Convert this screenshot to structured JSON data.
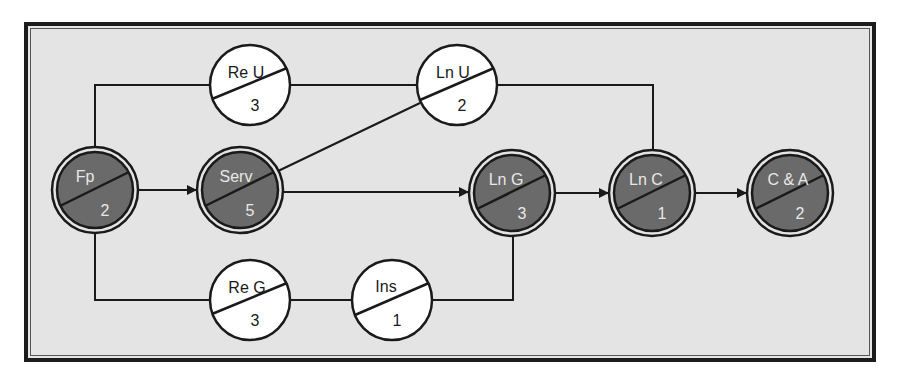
{
  "diagram": {
    "type": "activity-network",
    "colors": {
      "background": "#e4e4e4",
      "frame": "#1c1c1c",
      "critical_fill": "#6a6a6a",
      "noncritical_fill": "#ffffff",
      "line": "#1a1a1a",
      "critical_text": "#e8e8e8",
      "noncritical_text": "#1a1a1a"
    },
    "nodes": [
      {
        "id": "fp",
        "label": "Fp",
        "duration": "2",
        "critical": true
      },
      {
        "id": "serv",
        "label": "Serv",
        "duration": "5",
        "critical": true
      },
      {
        "id": "reu",
        "label": "Re U",
        "duration": "3",
        "critical": false
      },
      {
        "id": "lnu",
        "label": "Ln U",
        "duration": "2",
        "critical": false
      },
      {
        "id": "lng",
        "label": "Ln G",
        "duration": "3",
        "critical": true
      },
      {
        "id": "lnc",
        "label": "Ln C",
        "duration": "1",
        "critical": true
      },
      {
        "id": "ca",
        "label": "C & A",
        "duration": "2",
        "critical": true
      },
      {
        "id": "reg",
        "label": "Re G",
        "duration": "3",
        "critical": false
      },
      {
        "id": "ins",
        "label": "Ins",
        "duration": "1",
        "critical": false
      }
    ],
    "edges": [
      {
        "from": "fp",
        "to": "serv",
        "arrow": true
      },
      {
        "from": "fp",
        "to": "reu",
        "arrow": false
      },
      {
        "from": "fp",
        "to": "reg",
        "arrow": false
      },
      {
        "from": "reu",
        "to": "lnu",
        "arrow": false
      },
      {
        "from": "serv",
        "to": "lnu",
        "arrow": false
      },
      {
        "from": "serv",
        "to": "lng",
        "arrow": true
      },
      {
        "from": "lnu",
        "to": "lnc",
        "arrow": false
      },
      {
        "from": "reg",
        "to": "ins",
        "arrow": false
      },
      {
        "from": "ins",
        "to": "lng",
        "arrow": false
      },
      {
        "from": "lng",
        "to": "lnc",
        "arrow": true
      },
      {
        "from": "lnc",
        "to": "ca",
        "arrow": true
      }
    ]
  }
}
